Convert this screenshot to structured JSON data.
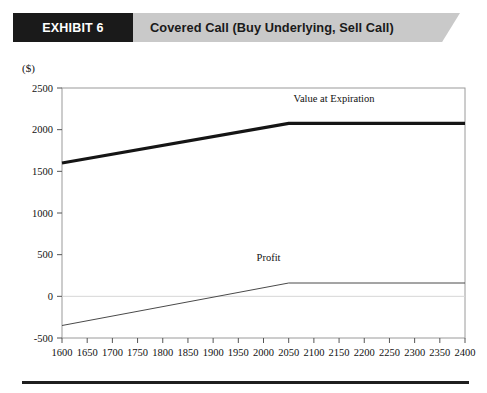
{
  "header": {
    "exhibit_tag": "EXHIBIT 6",
    "title": "Covered Call (Buy Underlying, Sell Call)",
    "tag_bg": "#1a1a1a",
    "band_bg": "#c9c9c9"
  },
  "chart_data": {
    "type": "line",
    "title": "Covered Call (Buy Underlying, Sell Call)",
    "unit_label": "($)",
    "xlabel": "Value of Underlying at Expiration (S",
    "xlabel_sub": "T",
    "xlabel_tail": ")",
    "ylabel": "",
    "xlim": [
      1600,
      2400
    ],
    "ylim": [
      -500,
      2500
    ],
    "grid": false,
    "zero_line": true,
    "legend_position": "inline-annotations",
    "x_ticks": [
      1600,
      1650,
      1700,
      1750,
      1800,
      1850,
      1900,
      1950,
      2000,
      2050,
      2100,
      2150,
      2200,
      2250,
      2300,
      2350,
      2400
    ],
    "y_ticks": [
      -500,
      0,
      500,
      1000,
      1500,
      2000,
      2500
    ],
    "x_tick_labels": [
      "1600",
      "1650",
      "1700",
      "1750",
      "1800",
      "1850",
      "1900",
      "1950",
      "2000",
      "2050",
      "2100",
      "2150",
      "2200",
      "2250",
      "2300",
      "2350",
      "2400"
    ],
    "y_tick_labels": [
      "-500",
      "0",
      "500",
      "1000",
      "1500",
      "2000",
      "2500"
    ],
    "series": [
      {
        "name": "Value  at Expiration",
        "color": "#151515",
        "width": 3.2,
        "x": [
          1600,
          2050,
          2400
        ],
        "values": [
          1600,
          2075,
          2075
        ]
      },
      {
        "name": "Profit",
        "color": "#4a4a4a",
        "width": 1.0,
        "x": [
          1600,
          2050,
          2400
        ],
        "values": [
          -350,
          160,
          160
        ]
      }
    ],
    "annotations": [
      {
        "text": "Value  at Expiration",
        "x": 2140,
        "y": 2330
      },
      {
        "text": "Profit",
        "x": 2010,
        "y": 420
      }
    ]
  }
}
